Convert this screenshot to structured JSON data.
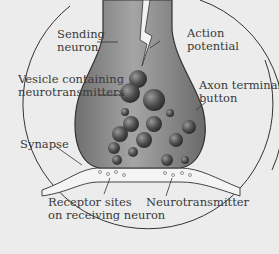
{
  "diagram": {
    "colors": {
      "background": "#ececec",
      "neuron_fill": "#8a8a8a",
      "neuron_dark": "#5e5e5e",
      "vesicle": "#4a4a4a",
      "receiving_neuron": "#f4f4f4",
      "outline": "#333333"
    },
    "labels": {
      "sending_neuron": [
        "Sending",
        "neuron"
      ],
      "action_potential": [
        "Action",
        "potential"
      ],
      "vesicle": [
        "Vesicle containing",
        "neurotransmitters"
      ],
      "axon_terminal": [
        "Axon terminal",
        "button"
      ],
      "synapse": [
        "Synapse"
      ],
      "receptor_sites": [
        "Receptor sites",
        "on receiving neuron"
      ],
      "neurotransmitter": [
        "Neurotransmitter"
      ]
    }
  }
}
